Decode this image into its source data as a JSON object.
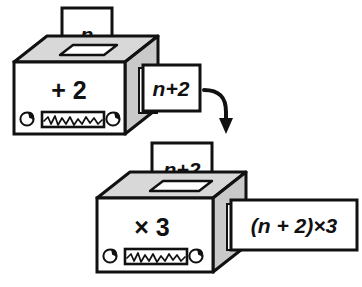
{
  "figure": {
    "background_color": "#ffffff",
    "ink_color": "#111111",
    "panel_face_color": "#ffffff",
    "panel_top_color": "#d8d8d8",
    "panel_side_color": "#c9c9c9"
  },
  "machines": [
    {
      "id": "machine-add-two",
      "operation_label": "+ 2",
      "input_card": {
        "label": "n",
        "name": "input-card-n"
      },
      "output_card": {
        "label": "n+2",
        "name": "output-card-n-plus-2"
      },
      "controls": {
        "left_knob": "knob-icon",
        "meter": "waveform-meter-icon",
        "right_knob": "knob-icon"
      }
    },
    {
      "id": "machine-times-three",
      "operation_label": "× 3",
      "input_card": {
        "label": "n+2",
        "name": "input-card-n-plus-2"
      },
      "output_card": {
        "label": "(n + 2)×3",
        "name": "output-card-result"
      },
      "controls": {
        "left_knob": "knob-icon",
        "meter": "waveform-meter-icon",
        "right_knob": "knob-icon"
      }
    }
  ],
  "connector": {
    "name": "curved-arrow",
    "from": "output-card-n-plus-2",
    "to": "input-card-n-plus-2"
  }
}
